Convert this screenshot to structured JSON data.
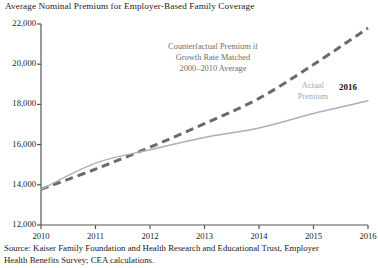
{
  "chart_data": {
    "type": "line",
    "title": "Average Nominal Premium for Employer-Based Family Coverage",
    "xlabel": "",
    "ylabel": "",
    "xlim": [
      2010,
      2016
    ],
    "ylim": [
      12000,
      22000
    ],
    "grid": false,
    "legend": "none (inline annotations)",
    "x": [
      2010,
      2011,
      2012,
      2013,
      2014,
      2015,
      2016
    ],
    "y_ticks": [
      12000,
      14000,
      16000,
      18000,
      20000,
      22000
    ],
    "y_tick_labels": [
      "12,000",
      "14,000",
      "16,000",
      "18,000",
      "20,000",
      "22,000"
    ],
    "x_ticks": [
      2010,
      2011,
      2012,
      2013,
      2014,
      2015,
      2016
    ],
    "x_tick_labels": [
      "2010",
      "2011",
      "2012",
      "2013",
      "2014",
      "2015",
      "2016"
    ],
    "series": [
      {
        "name": "Counterfactual Premium if Growth Rate Matched 2000-2010 Average",
        "style": "dashed",
        "color": "#6a6a6a",
        "values": [
          13770,
          14780,
          15870,
          17040,
          18300,
          19980,
          21800
        ]
      },
      {
        "name": "Actual Premium",
        "style": "solid",
        "color": "#b0b0b0",
        "values": [
          13770,
          15080,
          15740,
          16350,
          16830,
          17550,
          18180
        ]
      }
    ],
    "annotations": [
      {
        "id": "counterfactual-label",
        "lines": [
          "Counterfactual Premium if",
          "Growth Rate Matched",
          "2000–2010 Average"
        ],
        "color": "#6f6f6f"
      },
      {
        "id": "actual-label",
        "lines": [
          "Actual",
          "Premium"
        ],
        "color": "#a8a8a8"
      },
      {
        "id": "endpoint-year-label",
        "text": "2016",
        "color": "#111111"
      }
    ]
  },
  "source": {
    "line1": "Source: Kaiser Family Foundation and Health Research and Educational Trust, Employer",
    "line2": "Health Benefits Survey; CEA calculations."
  },
  "colors": {
    "counterfactual": "#6a6a6a",
    "actual": "#b0b0b0",
    "axis": "#555555",
    "text": "#1a1a1a"
  }
}
